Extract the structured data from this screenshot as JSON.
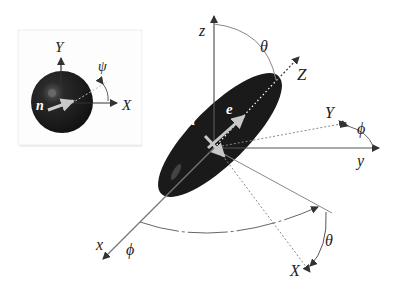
{
  "inset": {
    "labels": {
      "Y": "Y",
      "X": "X",
      "psi": "ψ",
      "n": "n"
    },
    "colors": {
      "sphere": "#1e1e1e",
      "axis": "#333333",
      "normal_arrow": "#bdbdbd",
      "border": "#e6e6e6"
    }
  },
  "main": {
    "labels": {
      "z": "z",
      "y": "y",
      "x": "x",
      "Z": "Z",
      "Y": "Y",
      "X": "X",
      "theta_top": "θ",
      "theta_bottom": "θ",
      "phi_right": "ϕ",
      "phi_bottom": "ϕ",
      "n": "n",
      "e": "e"
    },
    "colors": {
      "ellipsoid": "#1a1a1a",
      "axis": "#333333",
      "guide": "#888888",
      "arrow_light": "#c8c8c8"
    }
  }
}
